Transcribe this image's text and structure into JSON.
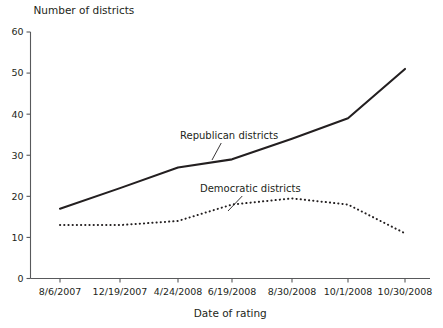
{
  "chart_data": {
    "type": "line",
    "title": "",
    "ylabel": "Number of districts",
    "xlabel": "Date of rating",
    "categories": [
      "8/6/2007",
      "12/19/2007",
      "4/24/2008",
      "6/19/2008",
      "8/30/2008",
      "10/1/2008",
      "10/30/2008"
    ],
    "ylim": [
      0,
      60
    ],
    "yticks": [
      0,
      10,
      20,
      30,
      40,
      50,
      60
    ],
    "ytick_labels": [
      "0",
      "10",
      "20",
      "30",
      "40",
      "50",
      "60"
    ],
    "grid": false,
    "legend_position": "inline-annotations",
    "series": [
      {
        "name": "Republican districts",
        "style": "solid",
        "values": [
          17,
          22,
          27,
          29,
          34,
          39,
          51
        ]
      },
      {
        "name": "Democratic districts",
        "style": "dotted",
        "values": [
          13,
          13,
          14,
          18,
          19.5,
          18,
          11
        ]
      }
    ],
    "annotations": [
      {
        "text": "Republican districts",
        "label_x": 180,
        "label_y": 139,
        "leader_to_x": 212,
        "leader_to_y": 160
      },
      {
        "text": "Democratic districts",
        "label_x": 200,
        "label_y": 192,
        "leader_to_x": 228,
        "leader_to_y": 211
      }
    ]
  },
  "colors": {
    "ink": "#231f20",
    "axis": "#58595b",
    "background": "#ffffff"
  }
}
